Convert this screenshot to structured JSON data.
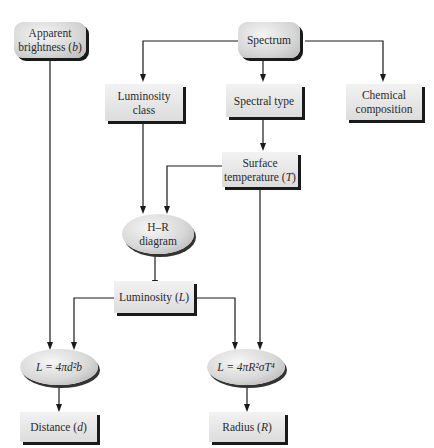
{
  "diagram": {
    "nodes": {
      "apparent_brightness": {
        "label": "Apparent brightness",
        "var": "b",
        "shape": "rounded"
      },
      "spectrum": {
        "label": "Spectrum",
        "shape": "rounded"
      },
      "luminosity_class": {
        "label": "Luminosity class",
        "shape": "rect"
      },
      "spectral_type": {
        "label": "Spectral type",
        "shape": "rect"
      },
      "chemical_composition": {
        "label": "Chemical composition",
        "shape": "rect"
      },
      "surface_temperature": {
        "label": "Surface temperature",
        "var": "T",
        "shape": "rect"
      },
      "hr_diagram": {
        "label": "H–R diagram",
        "shape": "oval"
      },
      "luminosity": {
        "label": "Luminosity",
        "var": "L",
        "shape": "rect"
      },
      "eq_distance": {
        "label": "L = 4πd²b",
        "shape": "oval"
      },
      "eq_radius": {
        "label": "L = 4πR²σT⁴",
        "shape": "oval"
      },
      "distance": {
        "label": "Distance",
        "var": "d",
        "shape": "rect"
      },
      "radius": {
        "label": "Radius",
        "var": "R",
        "shape": "rect"
      }
    },
    "edges": [
      {
        "from": "spectrum",
        "to": "luminosity_class"
      },
      {
        "from": "spectrum",
        "to": "spectral_type"
      },
      {
        "from": "spectrum",
        "to": "chemical_composition"
      },
      {
        "from": "spectral_type",
        "to": "surface_temperature"
      },
      {
        "from": "luminosity_class",
        "to": "hr_diagram"
      },
      {
        "from": "surface_temperature",
        "to": "hr_diagram"
      },
      {
        "from": "hr_diagram",
        "to": "luminosity"
      },
      {
        "from": "apparent_brightness",
        "to": "eq_distance"
      },
      {
        "from": "luminosity",
        "to": "eq_distance"
      },
      {
        "from": "luminosity",
        "to": "eq_radius"
      },
      {
        "from": "surface_temperature",
        "to": "eq_radius"
      },
      {
        "from": "eq_distance",
        "to": "distance"
      },
      {
        "from": "eq_radius",
        "to": "radius"
      }
    ],
    "colors": {
      "line": "#1a1a1a",
      "box_light": "#f2f2f2",
      "box_dark": "#d6d6d6",
      "shadow": "#1a1a1a"
    }
  }
}
